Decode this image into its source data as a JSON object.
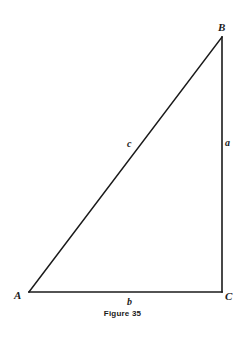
{
  "diagram": {
    "type": "right-triangle",
    "vertices": {
      "A": {
        "label": "A",
        "x": 29,
        "y": 292
      },
      "B": {
        "label": "B",
        "x": 222,
        "y": 37
      },
      "C": {
        "label": "C",
        "x": 222,
        "y": 292
      }
    },
    "sides": {
      "a": {
        "label": "a",
        "from": "B",
        "to": "C"
      },
      "b": {
        "label": "b",
        "from": "A",
        "to": "C"
      },
      "c": {
        "label": "c",
        "from": "A",
        "to": "B"
      }
    },
    "right_angle_at": "C",
    "stroke_color": "#1a1a1a",
    "background_color": "#ffffff"
  },
  "caption": "Figure 35"
}
